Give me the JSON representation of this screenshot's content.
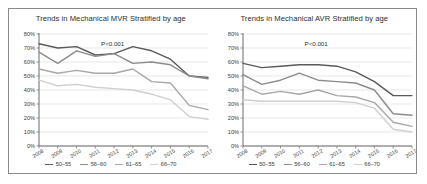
{
  "figure": {
    "border_color": "#8a8a8a",
    "background": "#ffffff"
  },
  "series_colors": {
    "50-55": "#5a5a5a",
    "56-60": "#8c8c8c",
    "61-65": "#a8a8a8",
    "66-70": "#cfcfcf"
  },
  "legend": {
    "items": [
      {
        "label": "50–55",
        "color": "#5a5a5a"
      },
      {
        "label": "56–60",
        "color": "#8c8c8c"
      },
      {
        "label": "61–65",
        "color": "#a8a8a8"
      },
      {
        "label": "66–70",
        "color": "#cfcfcf"
      }
    ]
  },
  "panels": [
    {
      "id": "mvr",
      "title": "Trends in Mechanical MVR Stratified by age",
      "pvalue": "P<0.001"
    },
    {
      "id": "avr",
      "title": "Trends in Mechanical AVR Stratified by age",
      "pvalue": "P<0.001"
    }
  ],
  "chart_data": [
    {
      "type": "line",
      "title": "Trends in Mechanical MVR Stratified by age",
      "xlabel": "",
      "ylabel": "",
      "annotations": [
        "P<0.001"
      ],
      "grid": true,
      "legend_position": "bottom",
      "categories": [
        "2008",
        "2009",
        "2010",
        "2011",
        "2012",
        "2013",
        "2014",
        "2015",
        "2016",
        "2017"
      ],
      "ytick_labels": [
        "0%",
        "10%",
        "20%",
        "30%",
        "40%",
        "50%",
        "60%",
        "70%",
        "80%"
      ],
      "ylim": [
        0,
        80
      ],
      "series": [
        {
          "name": "50–55",
          "color": "#5a5a5a",
          "values": [
            73,
            70,
            71,
            65,
            66,
            71,
            68,
            62,
            50,
            49
          ]
        },
        {
          "name": "56–60",
          "color": "#8c8c8c",
          "values": [
            67,
            59,
            68,
            64,
            66,
            59,
            60,
            58,
            50,
            48
          ]
        },
        {
          "name": "61–65",
          "color": "#a8a8a8",
          "values": [
            55,
            52,
            54,
            52,
            52,
            55,
            46,
            45,
            29,
            26
          ]
        },
        {
          "name": "66–70",
          "color": "#cfcfcf",
          "values": [
            47,
            43,
            44,
            42,
            41,
            40,
            37,
            33,
            21,
            19
          ]
        }
      ]
    },
    {
      "type": "line",
      "title": "Trends in Mechanical AVR Stratified by age",
      "xlabel": "",
      "ylabel": "",
      "annotations": [
        "P<0.001"
      ],
      "grid": true,
      "legend_position": "bottom",
      "categories": [
        "2008",
        "2009",
        "2010",
        "2011",
        "2012",
        "2013",
        "2014",
        "2015",
        "2016",
        "2017"
      ],
      "ytick_labels": [
        "0%",
        "10%",
        "20%",
        "30%",
        "40%",
        "50%",
        "60%",
        "70%",
        "80%"
      ],
      "ylim": [
        0,
        80
      ],
      "series": [
        {
          "name": "50–55",
          "color": "#5a5a5a",
          "values": [
            59,
            56,
            57,
            58,
            58,
            57,
            53,
            46,
            36,
            36
          ]
        },
        {
          "name": "56–60",
          "color": "#8c8c8c",
          "values": [
            51,
            44,
            47,
            52,
            47,
            46,
            45,
            40,
            23,
            22
          ]
        },
        {
          "name": "61–65",
          "color": "#a8a8a8",
          "values": [
            43,
            37,
            39,
            37,
            40,
            36,
            35,
            31,
            17,
            14
          ]
        },
        {
          "name": "66–70",
          "color": "#cfcfcf",
          "values": [
            33,
            32,
            32,
            32,
            32,
            32,
            31,
            27,
            12,
            10
          ]
        }
      ]
    }
  ]
}
